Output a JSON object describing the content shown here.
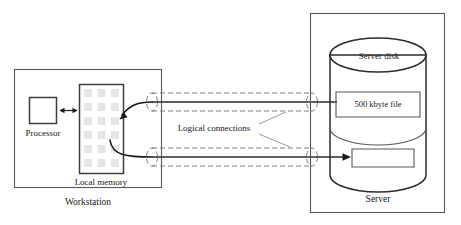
{
  "diagram": {
    "background_color": "#ffffff",
    "line_color": "#2b2d2f",
    "dashed_line_color": "#6e7378",
    "memory_cell_color": "#e6e6e6"
  },
  "workstation": {
    "label": "Workstation",
    "processor": {
      "label": "Processor"
    },
    "local_memory": {
      "label": "Local memory",
      "grid_columns": 3,
      "grid_rows": 6
    }
  },
  "server": {
    "label": "Server",
    "disk": {
      "label": "Server disk",
      "blocks": [
        {
          "label": "500 kbyte file"
        },
        {
          "label": ""
        }
      ]
    }
  },
  "connections": {
    "label": "Logical connections",
    "count": 2,
    "tubes": [
      {
        "name": "upper-logical-connection"
      },
      {
        "name": "lower-logical-connection"
      }
    ]
  }
}
